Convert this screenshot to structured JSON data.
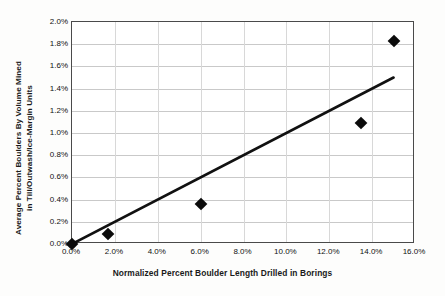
{
  "chart_data": {
    "type": "scatter",
    "title": "",
    "xlabel": "Normalized Percent Boulder Length Drilled in Borings",
    "ylabel": "Average Percent Boulders By Volume Mined in Till/Outwash/Ice-Margin Units",
    "ylabel_line1": "Average Percent Boulders By Volume Mined",
    "ylabel_line2": "in Till/Outwash/Ice-Margin Units",
    "xlim": [
      0.0,
      16.0
    ],
    "ylim": [
      0.0,
      2.0
    ],
    "xticks": [
      0.0,
      2.0,
      4.0,
      6.0,
      8.0,
      10.0,
      12.0,
      14.0,
      16.0
    ],
    "yticks": [
      0.0,
      0.2,
      0.4,
      0.6,
      0.8,
      1.0,
      1.2,
      1.4,
      1.6,
      1.8,
      2.0
    ],
    "xtick_labels": [
      "0.0%",
      "2.0%",
      "4.0%",
      "6.0%",
      "8.0%",
      "10.0%",
      "12.0%",
      "14.0%",
      "16.0%"
    ],
    "ytick_labels": [
      "0.0%",
      "0.2%",
      "0.4%",
      "0.6%",
      "0.8%",
      "1.0%",
      "1.2%",
      "1.4%",
      "1.6%",
      "1.8%",
      "2.0%"
    ],
    "grid": true,
    "grid_axis": "both",
    "legend": false,
    "marker": "diamond",
    "marker_color": "#0b0b0b",
    "series": [
      {
        "name": "Boulder observations",
        "points": [
          {
            "x": 0.0,
            "y": 0.0
          },
          {
            "x": 1.7,
            "y": 0.09
          },
          {
            "x": 6.0,
            "y": 0.36
          },
          {
            "x": 13.5,
            "y": 1.09
          },
          {
            "x": 15.0,
            "y": 1.83
          }
        ]
      }
    ],
    "trendline": {
      "name": "Linear trend",
      "color": "#111111",
      "width_px": 2.6,
      "x0": 0.0,
      "y0": 0.0,
      "x1": 15.0,
      "y1": 1.5
    }
  }
}
